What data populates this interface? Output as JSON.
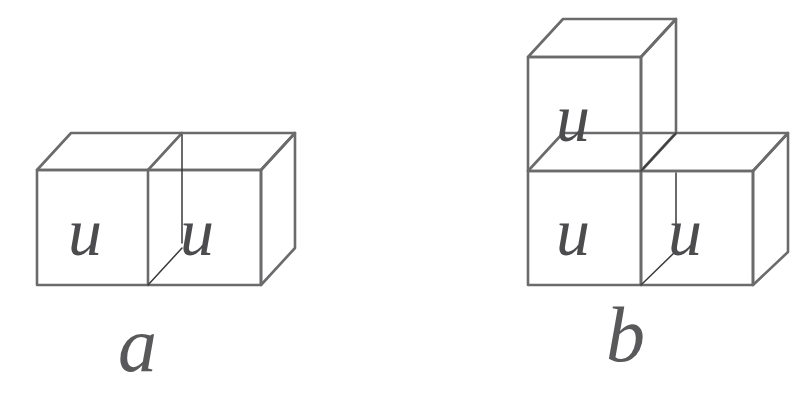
{
  "document": {
    "type": "geometric-figure",
    "description": "Two line-drawn cube assemblies labelled a and b, each unit cube face marked with the italic letter u",
    "background_color": "#ffffff"
  },
  "style": {
    "edge_color": "#6b6b6d",
    "hidden_edge_color": "#3a3a3c",
    "letter_color": "#4c4c4e",
    "caption_color": "#59595b",
    "edge_width": 2.6,
    "hidden_edge_width": 1.6
  },
  "figures": [
    {
      "id": "figure-a",
      "caption": "a",
      "caption_position": {
        "x": 118,
        "y": 306
      },
      "cube_count": 2,
      "arrangement": "1x2 horizontal row",
      "face_letters": [
        {
          "text": "u",
          "x": 68,
          "y": 198
        },
        {
          "text": "u",
          "x": 180,
          "y": 198
        }
      ],
      "geometry": {
        "front_left": 37,
        "front_right": 261,
        "front_top": 170,
        "front_bottom": 285,
        "depth_dx": 34,
        "depth_dy": -37,
        "divider_x": 148
      }
    },
    {
      "id": "figure-b",
      "caption": "b",
      "caption_position": {
        "x": 606,
        "y": 296
      },
      "cube_count": 3,
      "arrangement": "L-shape: two cubes on the bottom row, one cube stacked on the left bottom cube",
      "face_letters": [
        {
          "text": "u",
          "x": 556,
          "y": 84
        },
        {
          "text": "u",
          "x": 556,
          "y": 198
        },
        {
          "text": "u",
          "x": 668,
          "y": 198
        }
      ],
      "geometry": {
        "front_left": 528,
        "front_mid": 641,
        "front_right": 753,
        "front_top_upper": 57,
        "front_top_lower": 171,
        "front_bottom": 285,
        "depth_dx": 35,
        "depth_dy": -38
      }
    }
  ]
}
